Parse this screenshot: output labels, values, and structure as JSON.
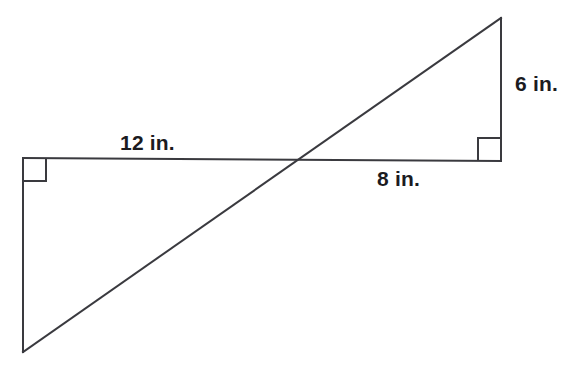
{
  "figure": {
    "background_color": "#ffffff",
    "stroke_color": "#3a3a3f",
    "text_color": "#1b1b1f",
    "width": 571,
    "height": 365
  },
  "labels": {
    "top_segment": "12 in.",
    "bottom_segment": "8 in.",
    "right_segment": "6 in."
  },
  "chart_data": {
    "type": "diagram",
    "units": "in.",
    "points": {
      "A": [
        23,
        158
      ],
      "B": [
        23,
        352
      ],
      "C": [
        501,
        161
      ],
      "D": [
        501,
        18
      ],
      "X": [
        298,
        163
      ]
    },
    "segments": [
      {
        "name": "horizontal",
        "from": [
          23,
          158
        ],
        "to": [
          501,
          161
        ]
      },
      {
        "name": "left-vertical",
        "from": [
          23,
          158
        ],
        "to": [
          23,
          352
        ]
      },
      {
        "name": "right-vertical",
        "from": [
          501,
          18
        ],
        "to": [
          501,
          161
        ]
      },
      {
        "name": "diagonal",
        "from": [
          23,
          352
        ],
        "to": [
          501,
          18
        ]
      }
    ],
    "right_angles": [
      {
        "name": "left-right-angle",
        "vertex": [
          23,
          158
        ],
        "size": 23,
        "dx": 1,
        "dy": 1
      },
      {
        "name": "right-right-angle",
        "vertex": [
          501,
          161
        ],
        "size": 23,
        "dx": -1,
        "dy": -1
      }
    ],
    "measurements": [
      {
        "label": "12 in.",
        "value": 12,
        "segment": "A to X (upper-left leg)"
      },
      {
        "label": "8 in.",
        "value": 8,
        "segment": "X to C (lower-right leg)"
      },
      {
        "label": "6 in.",
        "value": 6,
        "segment": "C to D (right vertical leg)"
      }
    ]
  }
}
